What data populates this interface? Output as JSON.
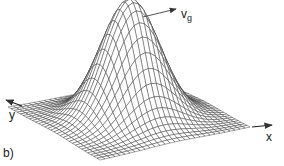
{
  "figure": {
    "panel_label": "b)",
    "axes": {
      "x_label": "x",
      "y_label": "y"
    },
    "velocity_label": {
      "main": "v",
      "subscript": "g"
    },
    "surface": {
      "type": "gaussian-wave-packet-mesh",
      "grid_lines": 30,
      "amplitude_px": 120,
      "sigma": 0.17,
      "corners": {
        "left": [
          8,
          107
        ],
        "back": [
          163,
          81
        ],
        "right": [
          250,
          127
        ],
        "front": [
          100,
          160
        ]
      },
      "line_color": "#333333",
      "fill_color": "#ffffff"
    },
    "colors": {
      "text": "#222222",
      "arrow": "#555555"
    }
  }
}
